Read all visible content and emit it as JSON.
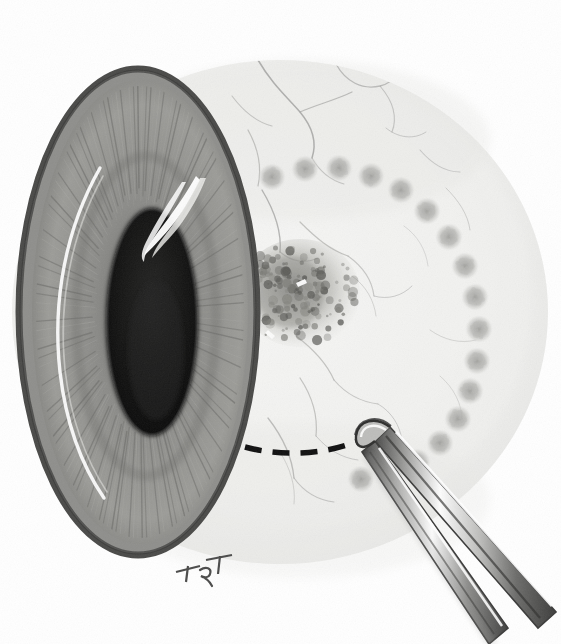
{
  "illustration": {
    "title": "Transscleral resection of ciliary body / iris lesion",
    "subtitle": "Surgical technique illustration of the anterior eye",
    "medium": "graphite and wash medical illustration",
    "background_color": "#ffffff",
    "width": 561,
    "height": 644,
    "artist_signature": "TRT",
    "signature_position": {
      "x": 196,
      "y": 566
    }
  },
  "palette": {
    "background": "#ffffff",
    "sclera_base": "#f4f4f3",
    "sclera_shadow": "#e2e2e0",
    "cornea_limbus_ring": "#4a4a48",
    "iris_mid": "#8d8d8a",
    "iris_dark": "#636360",
    "iris_light": "#b4b4b0",
    "pupil": "#151515",
    "highlight_white": "#ffffff",
    "vessel_gray": "#9a9a98",
    "treatment_spot": "#b9b9b6",
    "lesion_dark": "#5c5c59",
    "incision_black": "#101010",
    "instrument_steel_dark": "#3d3d3c",
    "instrument_steel_mid": "#9d9d9b",
    "instrument_steel_light": "#fdfdfd",
    "signature_ink": "#4b4b4a"
  },
  "structures": {
    "globe": {
      "name": "eyeball-anterior-segment",
      "label": "Anterior segment of the globe",
      "center": {
        "x": 280,
        "y": 312
      },
      "radius_x": 268,
      "radius_y": 252
    },
    "cornea": {
      "name": "cornea",
      "label": "Cornea with limbal ring",
      "center": {
        "x": 138,
        "y": 312
      },
      "radius_x": 120,
      "radius_y": 244,
      "limbus_ring_width": 7,
      "top_y": 68,
      "bottom_y": 556
    },
    "iris": {
      "name": "iris",
      "label": "Iris with radial stromal striations",
      "center": {
        "x": 140,
        "y": 312
      },
      "radius_x": 104,
      "radius_y": 226,
      "striation_count": 150,
      "color": "#8d8d8a"
    },
    "pupil": {
      "name": "pupil",
      "label": "Pupil",
      "center": {
        "x": 152,
        "y": 322
      },
      "radius_x": 44,
      "radius_y": 112,
      "color": "#151515"
    },
    "corneal_reflex": {
      "name": "corneal-light-reflex",
      "label": "Specular corneal light reflex",
      "description": "Tapered white highlight above the pupil pointing superotemporally"
    },
    "limbal_arc_highlight": {
      "name": "limbal-highlight-arc",
      "label": "Curved white highlight along nasal corneal margin"
    },
    "sclera": {
      "name": "sclera",
      "label": "Sclera with overlying conjunctiva",
      "color": "#f4f4f3"
    },
    "lesion": {
      "name": "pigmented-lesion",
      "label": "Pigmented ciliary body / limbal lesion",
      "center": {
        "x": 300,
        "y": 293
      },
      "radius_x": 58,
      "radius_y": 52,
      "stipple_count": 140,
      "color": "#5c5c59"
    },
    "incision_line": {
      "name": "planned-incision-line",
      "label": "Dashed line marking planned scleral incision",
      "dash_count": 7,
      "color": "#101010",
      "stroke_width": 5,
      "start": {
        "x": 245,
        "y": 447
      },
      "end": {
        "x": 372,
        "y": 437
      }
    }
  },
  "treatment_spots": {
    "name": "treatment-spot-arc",
    "label": "Arc of photocoagulation / cryotherapy spots surrounding the lesion",
    "count": 17,
    "diameter": 24,
    "color": "#b9b9b6",
    "positions": [
      {
        "x": 272,
        "y": 177
      },
      {
        "x": 305,
        "y": 169
      },
      {
        "x": 339,
        "y": 168
      },
      {
        "x": 371,
        "y": 176
      },
      {
        "x": 401,
        "y": 190
      },
      {
        "x": 427,
        "y": 211
      },
      {
        "x": 449,
        "y": 237
      },
      {
        "x": 465,
        "y": 266
      },
      {
        "x": 475,
        "y": 297
      },
      {
        "x": 479,
        "y": 329
      },
      {
        "x": 477,
        "y": 361
      },
      {
        "x": 470,
        "y": 391
      },
      {
        "x": 458,
        "y": 419
      },
      {
        "x": 440,
        "y": 443
      },
      {
        "x": 417,
        "y": 462
      },
      {
        "x": 390,
        "y": 474
      },
      {
        "x": 361,
        "y": 479
      }
    ]
  },
  "vessels": {
    "name": "conjunctival-vessels",
    "label": "Branching episcleral and conjunctival vessels",
    "color": "#9a9a98",
    "branch_count": 22
  },
  "instrument": {
    "name": "surgical-forceps",
    "label": "Fine-toothed surgical forceps",
    "type": "forceps",
    "tip_position": {
      "x": 379,
      "y": 432
    },
    "exit_position": {
      "x": 531,
      "y": 644
    },
    "arm_count": 2,
    "material": "polished stainless steel",
    "colors": {
      "outline": "#3d3d3c",
      "shaft": "#9d9d9b",
      "highlight": "#fdfdfd"
    }
  }
}
